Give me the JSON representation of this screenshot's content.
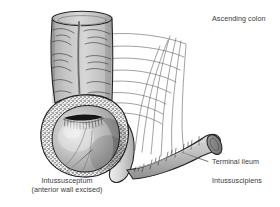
{
  "figure": {
    "background_color": "#ffffff",
    "line_color": "#2b2b2b",
    "text_color": "#3b3b3b"
  },
  "labels": {
    "ascending_colon": "Ascending colon",
    "terminal_ileum": "Terminal ileum",
    "intussuscipiens": "Intussuscipiens",
    "intussusceptum_line1": "Intussusceptum",
    "intussusceptum_line2": "(anterior wall excised)"
  },
  "structures": [
    {
      "name": "ascending-colon",
      "description": "Vertical segment of large bowel with haustral folds and a longitudinal taenia coli stripe, cut open at the top rim",
      "fill": "#c9c9c9"
    },
    {
      "name": "intussusceptum",
      "description": "Rounded invaginated bowel bulb with stippled cut-edge rim, dark slit-like lumen opening and anterior wall excised",
      "fill": "#b5b5b5"
    },
    {
      "name": "intussuscipiens",
      "description": "Sleeve of receiving bowel wrapping the neck of the intussusceptum",
      "fill": "#d6d6d6"
    },
    {
      "name": "terminal-ileum",
      "description": "Small bowel tube angling down and to the right with an elliptical cut end and mesenteric vessel tick marks",
      "fill": "#bcbcbc"
    },
    {
      "name": "mesentery",
      "description": "Fan of thin mesenteric vessel lines behind the bowel",
      "fill": "#ffffff"
    }
  ]
}
